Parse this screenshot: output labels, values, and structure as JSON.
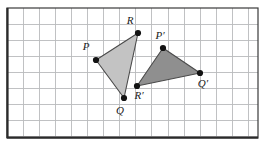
{
  "figure": {
    "kind": "geometry-transformation-diagram",
    "canvas": {
      "width": 267,
      "height": 150
    },
    "grid": {
      "left": 7,
      "top": 8,
      "right": 258,
      "bottom": 138,
      "cell_size": 16.1,
      "line_color": "#b9babd",
      "border_color": "#2b2b2b",
      "background": "#ffffff",
      "columns": 15,
      "rows": 8,
      "visible": true
    },
    "colors": {
      "preimage_fill": "#c3c3c3",
      "preimage_stroke": "#4a4a4a",
      "image_fill": "#8f8f8f",
      "image_stroke": "#4a4a4a",
      "vertex_dot": "#131313",
      "label_text": "#1a1a1a"
    },
    "shapes": [
      {
        "name": "triangle-pqr",
        "role": "preimage",
        "fill": "#c3c3c3",
        "stroke": "#4a4a4a",
        "points": "96,60 138,33 124,98",
        "vertices": [
          {
            "id": "P",
            "x": 96,
            "y": 60,
            "label": "P",
            "label_x": 86,
            "label_y": 50
          },
          {
            "id": "R",
            "x": 138,
            "y": 33,
            "label": "R",
            "label_x": 130,
            "label_y": 24
          },
          {
            "id": "Q",
            "x": 124,
            "y": 98,
            "label": "Q",
            "label_x": 120,
            "label_y": 114
          }
        ]
      },
      {
        "name": "triangle-p-prime-q-prime-r-prime",
        "role": "image",
        "fill": "#8f8f8f",
        "stroke": "#4a4a4a",
        "points": "163,48 200,73 137,86",
        "vertices": [
          {
            "id": "P'",
            "x": 163,
            "y": 48,
            "label": "P′",
            "label_x": 160,
            "label_y": 39
          },
          {
            "id": "Q'",
            "x": 200,
            "y": 73,
            "label": "Q′",
            "label_x": 203,
            "label_y": 87
          },
          {
            "id": "R'",
            "x": 137,
            "y": 86,
            "label": "R′",
            "label_x": 139,
            "label_y": 99
          }
        ]
      }
    ]
  }
}
